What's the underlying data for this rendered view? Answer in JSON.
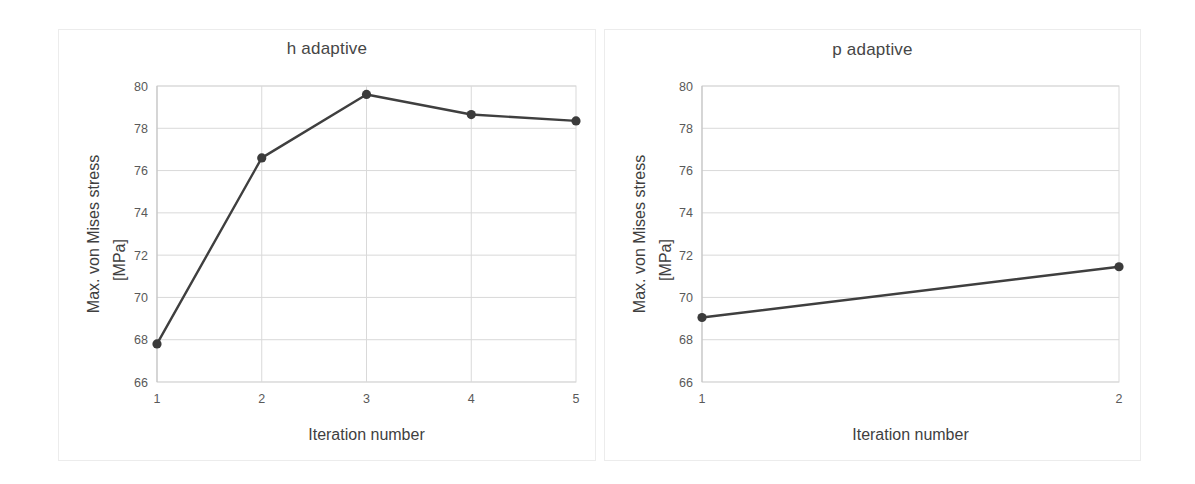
{
  "figure": {
    "background": "#ffffff",
    "panel_border_color": "#ececec",
    "grid_color": "#d9d9d9",
    "series_color": "#3b3b3b"
  },
  "panels": [
    {
      "id": "h-adaptive",
      "title": "h adaptive",
      "xlabel": "Iteration number",
      "ylabel_line1": "Max. von Mises stress",
      "ylabel_line2": "[MPa]"
    },
    {
      "id": "p-adaptive",
      "title": "p adaptive",
      "xlabel": "Iteration number",
      "ylabel_line1": "Max. von Mises stress",
      "ylabel_line2": "[MPa]"
    }
  ],
  "chart_data": [
    {
      "type": "line",
      "title": "h adaptive",
      "xlabel": "Iteration number",
      "ylabel": "Max. von Mises stress [MPa]",
      "x": [
        1,
        2,
        3,
        4,
        5
      ],
      "values": [
        67.8,
        76.6,
        79.6,
        78.65,
        78.35
      ],
      "xticklabels": [
        "1",
        "2",
        "3",
        "4",
        "5"
      ],
      "yticklabels": [
        "66",
        "68",
        "70",
        "72",
        "74",
        "76",
        "78",
        "80"
      ],
      "yticks": [
        66,
        68,
        70,
        72,
        74,
        76,
        78,
        80
      ],
      "xlim": [
        1,
        5
      ],
      "ylim": [
        66,
        80
      ],
      "grid": true,
      "legend": false,
      "marker": "circle"
    },
    {
      "type": "line",
      "title": "p adaptive",
      "xlabel": "Iteration number",
      "ylabel": "Max. von Mises stress [MPa]",
      "x": [
        1,
        2
      ],
      "values": [
        69.05,
        71.45
      ],
      "xticklabels": [
        "1",
        "2"
      ],
      "yticklabels": [
        "66",
        "68",
        "70",
        "72",
        "74",
        "76",
        "78",
        "80"
      ],
      "yticks": [
        66,
        68,
        70,
        72,
        74,
        76,
        78,
        80
      ],
      "xlim": [
        1,
        2
      ],
      "ylim": [
        66,
        80
      ],
      "grid": true,
      "legend": false,
      "marker": "circle"
    }
  ]
}
